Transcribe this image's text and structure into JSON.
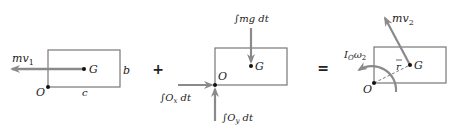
{
  "diagram": {
    "operators": {
      "plus": "+",
      "equals": "="
    },
    "panel1": {
      "name": "initial momentum",
      "labels": {
        "momentum": "mv",
        "momentum_sub": "1",
        "G": "G",
        "O": "O",
        "b": "b",
        "c": "c"
      }
    },
    "panel2": {
      "name": "external impulses",
      "labels": {
        "gravity_impulse": "∫mg dt",
        "ox_impulse": "∫O",
        "ox_sub": "x",
        "ox_tail": " dt",
        "oy_impulse": "∫O",
        "oy_sub": "y",
        "oy_tail": " dt",
        "G": "G",
        "O": "O"
      }
    },
    "panel3": {
      "name": "final momentum",
      "labels": {
        "momentum": "mv",
        "momentum_sub": "2",
        "angular": "I",
        "angular_sub": "O",
        "angular_omega": "ω",
        "angular_omega_sub": "2",
        "r": "r",
        "G": "G",
        "O": "O"
      }
    },
    "colors": {
      "box": "#777777",
      "arrow": "#8a8a8a",
      "text": "#222222",
      "dot": "#111111"
    }
  }
}
